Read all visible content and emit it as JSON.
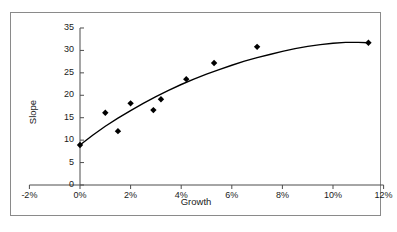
{
  "chart_data": {
    "type": "scatter",
    "title": "",
    "xlabel": "Growth",
    "ylabel": "Slope",
    "xlim": [
      -2,
      12
    ],
    "ylim": [
      0,
      35
    ],
    "grid": false,
    "legend": null,
    "x_tick_labels": [
      "-2%",
      "0%",
      "2%",
      "4%",
      "6%",
      "8%",
      "10%",
      "12%"
    ],
    "x_tick_values": [
      -2,
      0,
      2,
      4,
      6,
      8,
      10,
      12
    ],
    "y_tick_labels": [
      "0",
      "5",
      "10",
      "15",
      "20",
      "25",
      "30",
      "35"
    ],
    "y_tick_values": [
      0,
      5,
      10,
      15,
      20,
      25,
      30,
      35
    ],
    "x_unit": "percent",
    "marker": "diamond",
    "marker_color": "#000000",
    "line_color": "#000000",
    "points": [
      {
        "x": 0.0,
        "y": 8.9
      },
      {
        "x": 1.0,
        "y": 16.1
      },
      {
        "x": 1.5,
        "y": 12.0
      },
      {
        "x": 2.0,
        "y": 18.2
      },
      {
        "x": 2.9,
        "y": 16.7
      },
      {
        "x": 3.2,
        "y": 19.1
      },
      {
        "x": 4.2,
        "y": 23.6
      },
      {
        "x": 5.3,
        "y": 27.2
      },
      {
        "x": 7.0,
        "y": 30.8
      },
      {
        "x": 11.4,
        "y": 31.7
      }
    ],
    "fit_curve": {
      "name": "fitted trend",
      "x": [
        0.0,
        0.5,
        1.0,
        1.5,
        2.0,
        2.5,
        3.0,
        3.5,
        4.0,
        4.5,
        5.0,
        5.5,
        6.0,
        6.5,
        7.0,
        7.5,
        8.0,
        8.5,
        9.0,
        9.5,
        10.0,
        10.5,
        11.0,
        11.4
      ],
      "y": [
        8.9,
        11.1,
        13.1,
        14.9,
        16.6,
        18.2,
        19.7,
        21.1,
        22.4,
        23.6,
        24.7,
        25.7,
        26.7,
        27.6,
        28.4,
        29.1,
        29.8,
        30.4,
        30.9,
        31.3,
        31.6,
        31.8,
        31.8,
        31.7
      ]
    }
  },
  "axes": {
    "x_title": "Growth",
    "y_title": "Slope"
  }
}
